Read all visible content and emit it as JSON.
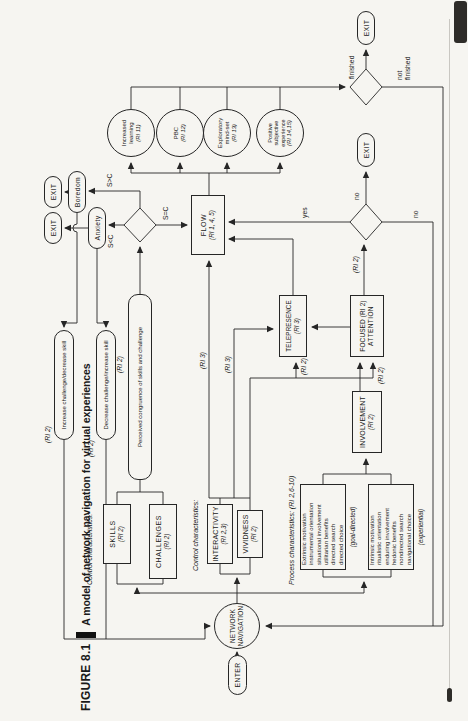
{
  "title": {
    "figure_label": "FIGURE 8.1",
    "text": "A model of network navigation for virtual experiences"
  },
  "terminals": {
    "enter": "ENTER",
    "exit": "EXIT"
  },
  "nn": [
    "NETWORK",
    "NAVIGATION"
  ],
  "labels": {
    "control": "Control characteristics:",
    "process": "Process characteristics: (RI 2,6-10)"
  },
  "boxes": {
    "skills": {
      "t": "SKILLS",
      "ri": "(RI 2)"
    },
    "challenges": {
      "t": "CHALLENGES",
      "ri": "(RI 2)"
    },
    "interactivity": {
      "t": "INTERACTIVITY",
      "ri": "(RI 2,3)"
    },
    "vividness": {
      "t": "VIVIDNESS",
      "ri": "(RI 2)"
    },
    "involvement": {
      "t": "INVOLVEMENT",
      "ri": "(RI 2)"
    },
    "focused": {
      "l1": "FOCUSED (RI 2)",
      "l2": "ATTENTION"
    },
    "telepresence": {
      "t": "TELEPRESENCE",
      "ri": "(RI 3)"
    },
    "flow": {
      "t": "FLOW",
      "ri": "(RI 1, 4, 5)"
    }
  },
  "stadiums": {
    "congruence": "Perceived congruence of skills and challenge",
    "increase": "Increase challenge/decrease skill",
    "decrease": "Decrease challenge/increase skill",
    "anxiety": "Anxiety",
    "boredom": "Boredom"
  },
  "process": {
    "goal": {
      "lines": [
        "Extrinsic motivation",
        "instrumental orientation",
        "situational involvement",
        "utilitarian benefits",
        "directed search",
        "directed choice"
      ],
      "caption": "(goal-directed)"
    },
    "experiential": {
      "lines": [
        "Intrinsic motivation",
        "ritualistic orientation",
        "enduring involvement",
        "hedonic benefits",
        "nondirected search",
        "navigational choice"
      ],
      "caption": "(experiential)"
    }
  },
  "outcomes": [
    {
      "lines": [
        "Increased",
        "learning"
      ],
      "ri": "(RI 11)"
    },
    {
      "lines": [
        "PBC"
      ],
      "ri": "(RI 12)"
    },
    {
      "lines": [
        "Exploratory",
        "mind-set"
      ],
      "ri": "(RI 13)"
    },
    {
      "lines": [
        "Positive",
        "subjective",
        "experience"
      ],
      "ri": "(RI 14,15)"
    }
  ],
  "edge": {
    "sgc": "S>C",
    "slc": "S<C",
    "sec": "S=C",
    "yes": "yes",
    "no": "no",
    "finished": "finished",
    "not_finished": "not finished",
    "ri2": "(RI 2)",
    "ri3": "(RI 3)"
  },
  "colors": {
    "line": "#262626",
    "background": "#f6f5f1"
  }
}
